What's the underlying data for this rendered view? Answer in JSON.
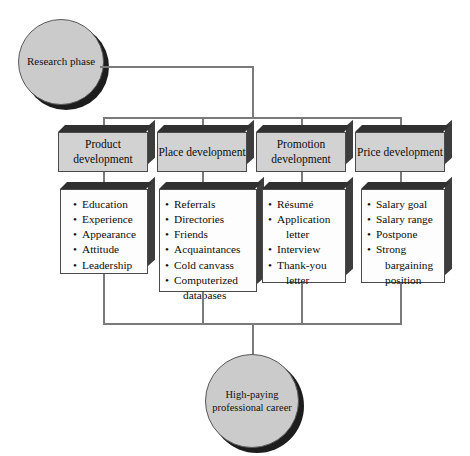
{
  "diagram": {
    "line_color": "#7a7a7a",
    "node_fill": "#cbcbcb",
    "header_fill": "#d2d2d2",
    "list_fill": "#fdfdfd",
    "start_node": {
      "label": "Research phase"
    },
    "end_node": {
      "label": "High-paying professional career"
    },
    "columns": [
      {
        "header": "Product development",
        "items": [
          "Education",
          "Experience",
          "Appearance",
          "Attitude",
          "Leadership"
        ]
      },
      {
        "header": "Place development",
        "items": [
          "Referrals",
          "Directories",
          "Friends",
          "Acquaintances",
          "Cold canvass",
          "Computerized databases"
        ]
      },
      {
        "header": "Promotion development",
        "items": [
          "Résumé",
          "Application letter",
          "Interview",
          "Thank-you letter"
        ]
      },
      {
        "header": "Price development",
        "items": [
          "Salary goal",
          "Salary range",
          "Postpone",
          "Strong bargaining position"
        ]
      }
    ]
  }
}
